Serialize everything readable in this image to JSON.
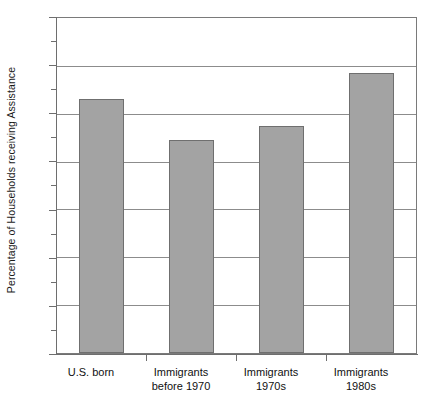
{
  "chart_data": {
    "type": "bar",
    "title": "",
    "xlabel": "",
    "ylabel": "Percentage of Households receiving Assistance",
    "categories": [
      "U.S. born",
      "Immigrants before 1970",
      "Immigrants 1970s",
      "Immigrants 1980s"
    ],
    "category_lines": [
      [
        "U.S. born",
        ""
      ],
      [
        "Immigrants",
        "before 1970"
      ],
      [
        "Immigrants",
        "1970s"
      ],
      [
        "Immigrants",
        "1980s"
      ]
    ],
    "values": [
      5.3,
      4.45,
      4.75,
      5.85
    ],
    "value_labels": [
      "5.3%",
      "4.45%",
      "4.75%",
      "5.85%"
    ],
    "ylim": [
      0,
      7
    ],
    "ytick_labels": [
      "7%",
      "6%",
      "5%",
      "4%",
      "3%",
      "2%",
      "1%",
      "0%"
    ],
    "ytick_values": [
      7,
      6,
      5,
      4,
      3,
      2,
      1,
      0
    ],
    "yminor_values": [
      6.5,
      5.5,
      4.5,
      3.5,
      2.5,
      1.5,
      0.5
    ],
    "grid": true,
    "legend": null,
    "colors": {
      "bar_fill": "#a3a3a3",
      "bar_border": "#6f6f6f",
      "gridline": "#8c8c8c",
      "axis": "#6e6e6e",
      "text": "#111111",
      "background": "#ffffff"
    }
  }
}
